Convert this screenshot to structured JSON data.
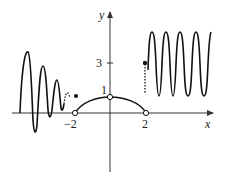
{
  "figure": {
    "axes": {
      "x_label": "x",
      "y_label": "y",
      "x_ticks": [
        {
          "value": -2,
          "label": "−2"
        },
        {
          "value": 2,
          "label": "2"
        }
      ],
      "y_ticks": [
        {
          "value": 1,
          "label": "1"
        },
        {
          "value": 3,
          "label": "3"
        }
      ]
    },
    "features": {
      "left_region": "damped oscillation for x < -2, with filled dot at y just above 1 near x = -2",
      "middle_region": "semicircle-like arc from (-2,0) to (2,0) through (0,1), open circles at (-2,0), (0,1), (2,0)",
      "right_region": "oscillation between 0 and 5 for x > 2, with filled dot at (2,3) and dashed vertical segment"
    },
    "colors": {
      "curve": "#111111",
      "axis": "#333333",
      "background": "#ffffff"
    }
  }
}
